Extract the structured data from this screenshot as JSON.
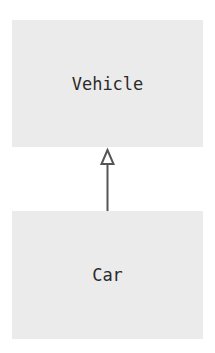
{
  "diagram": {
    "type": "uml-class-inheritance",
    "nodes": [
      {
        "id": "vehicle",
        "label": "Vehicle"
      },
      {
        "id": "car",
        "label": "Car"
      }
    ],
    "edges": [
      {
        "from": "car",
        "to": "vehicle",
        "relation": "inheritance",
        "arrowhead": "hollow-triangle"
      }
    ],
    "colors": {
      "box_fill": "#ebebeb",
      "text": "#2a2a2a",
      "arrow": "#555555",
      "background": "#ffffff"
    }
  }
}
